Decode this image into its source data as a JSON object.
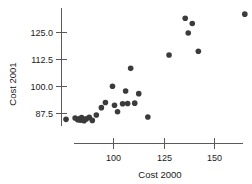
{
  "chart_data": {
    "type": "scatter",
    "title": "",
    "xlabel": "Cost 2000",
    "ylabel": "Cost 2001",
    "xticks": [
      100,
      125,
      150
    ],
    "xtick_labels": [
      "100",
      "125",
      "150"
    ],
    "yticks": [
      87.5,
      100.0,
      112.5,
      125.0
    ],
    "ytick_labels": [
      "87.5",
      "100.0",
      "112.5",
      "125.0"
    ],
    "xlim": [
      74,
      172
    ],
    "ylim": [
      82,
      134
    ],
    "grid": false,
    "legend": null,
    "marker_color": "#3b3b3b",
    "axis_color": "#5a5a5a",
    "points": [
      {
        "x": 76.5,
        "y": 84.8
      },
      {
        "x": 81.0,
        "y": 85.4
      },
      {
        "x": 82.3,
        "y": 84.6
      },
      {
        "x": 83.0,
        "y": 85.1
      },
      {
        "x": 83.6,
        "y": 84.4
      },
      {
        "x": 84.2,
        "y": 85.6
      },
      {
        "x": 84.8,
        "y": 84.9
      },
      {
        "x": 85.4,
        "y": 84.2
      },
      {
        "x": 86.5,
        "y": 85.0
      },
      {
        "x": 88.0,
        "y": 85.7
      },
      {
        "x": 89.5,
        "y": 84.3
      },
      {
        "x": 91.5,
        "y": 86.8
      },
      {
        "x": 94.0,
        "y": 90.2
      },
      {
        "x": 96.0,
        "y": 92.6
      },
      {
        "x": 99.5,
        "y": 100.1
      },
      {
        "x": 100.5,
        "y": 91.3
      },
      {
        "x": 102.0,
        "y": 88.3
      },
      {
        "x": 104.5,
        "y": 92.0
      },
      {
        "x": 106.0,
        "y": 97.9
      },
      {
        "x": 107.0,
        "y": 92.1
      },
      {
        "x": 108.5,
        "y": 108.4
      },
      {
        "x": 110.5,
        "y": 92.3
      },
      {
        "x": 112.5,
        "y": 96.7
      },
      {
        "x": 117.0,
        "y": 85.9
      },
      {
        "x": 127.5,
        "y": 114.6
      },
      {
        "x": 135.5,
        "y": 131.6
      },
      {
        "x": 137.0,
        "y": 124.8
      },
      {
        "x": 139.0,
        "y": 129.2
      },
      {
        "x": 142.0,
        "y": 116.3
      },
      {
        "x": 165.0,
        "y": 133.5
      }
    ]
  }
}
